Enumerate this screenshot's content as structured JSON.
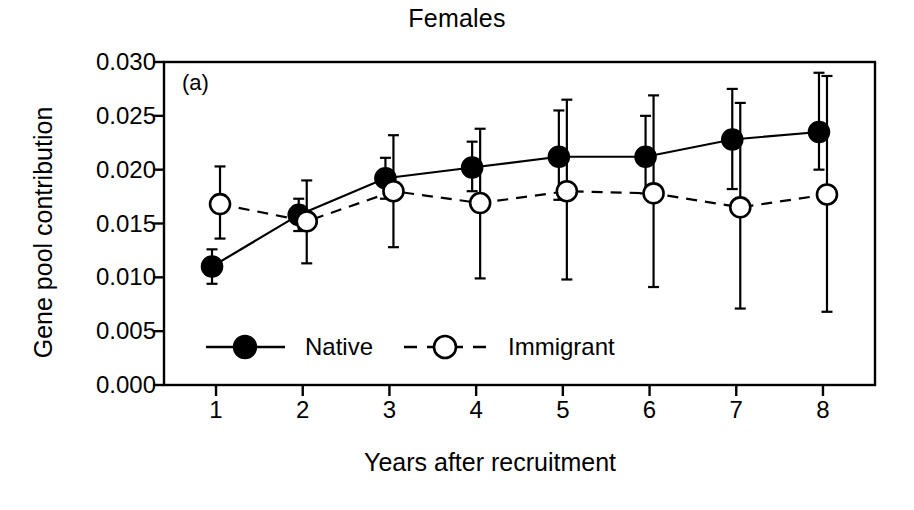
{
  "chart_data": {
    "type": "line",
    "title": "Females",
    "panel_label": "(a)",
    "xlabel": "Years after recruitment",
    "ylabel": "Gene pool contribution",
    "x": [
      1,
      2,
      3,
      4,
      5,
      6,
      7,
      8
    ],
    "xtick_labels": [
      "1",
      "2",
      "3",
      "4",
      "5",
      "6",
      "7",
      "8"
    ],
    "ytick_labels": [
      "0.000",
      "0.005",
      "0.010",
      "0.015",
      "0.020",
      "0.025",
      "0.030"
    ],
    "ytick_values": [
      0.0,
      0.005,
      0.01,
      0.015,
      0.02,
      0.025,
      0.03
    ],
    "ylim": [
      0.0,
      0.03
    ],
    "xlim": [
      0.4,
      8.6
    ],
    "grid": false,
    "legend_position": "inside-bottom-left",
    "series": [
      {
        "name": "Native",
        "marker": "filled-circle",
        "linestyle": "solid",
        "color": "#000000",
        "values": [
          0.011,
          0.0158,
          0.0192,
          0.0202,
          0.0212,
          0.0212,
          0.0228,
          0.0235
        ],
        "err_low": [
          0.0094,
          0.0143,
          0.0173,
          0.018,
          0.0172,
          0.0178,
          0.0182,
          0.02
        ],
        "err_high": [
          0.0126,
          0.0173,
          0.0211,
          0.0226,
          0.0255,
          0.025,
          0.0275,
          0.029
        ]
      },
      {
        "name": "Immigrant",
        "marker": "open-circle",
        "linestyle": "dashed",
        "color": "#000000",
        "values": [
          0.0168,
          0.0152,
          0.018,
          0.0169,
          0.018,
          0.0178,
          0.0165,
          0.0177
        ],
        "err_low": [
          0.0136,
          0.0113,
          0.0128,
          0.0099,
          0.0098,
          0.0091,
          0.0071,
          0.0068
        ],
        "err_high": [
          0.0203,
          0.019,
          0.0232,
          0.0238,
          0.0265,
          0.0269,
          0.0262,
          0.0287
        ]
      }
    ]
  },
  "legend": {
    "native_label": "Native",
    "immigrant_label": "Immigrant"
  }
}
